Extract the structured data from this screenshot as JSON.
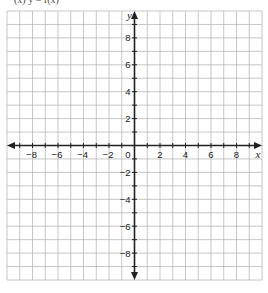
{
  "header_fragment": "(x)  y = f(x)",
  "grid": {
    "x_min": -10,
    "x_max": 10,
    "y_min": -10,
    "y_max": 10,
    "step": 1,
    "px_left": 7,
    "px_right": 262,
    "px_top": 11,
    "px_bottom": 280,
    "grid_color": "#b8b8b8",
    "axis_color": "#222222"
  },
  "axes": {
    "x_label": "x",
    "y_label": "y",
    "x_ticks": [
      -8,
      -6,
      -4,
      -2,
      2,
      4,
      6,
      8
    ],
    "y_ticks": [
      8,
      6,
      4,
      2,
      -2,
      -4,
      -6,
      -8
    ],
    "origin_label": "0"
  }
}
